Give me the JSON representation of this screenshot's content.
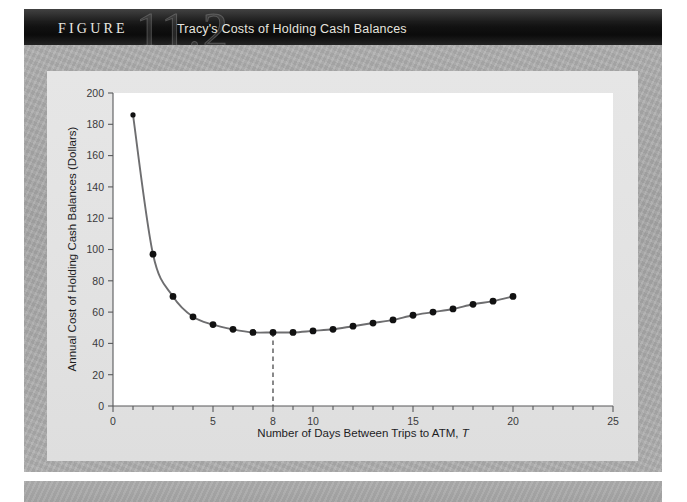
{
  "banner": {
    "figure_word": "FIGURE",
    "figure_number": "11.2",
    "title": "Tracy's Costs of Holding Cash Balances"
  },
  "chart_data": {
    "type": "line",
    "title": "Tracy's Costs of Holding Cash Balances",
    "xlabel": "Number of Days Between Trips to ATM, T",
    "ylabel": "Annual Cost of Holding Cash Balances (Dollars)",
    "xlim": [
      0,
      25
    ],
    "ylim": [
      0,
      200
    ],
    "grid": false,
    "legend": null,
    "x_ticks_major": [
      0,
      5,
      8,
      10,
      15,
      20,
      25
    ],
    "x_tick_labels": [
      "0",
      "5",
      "8",
      "10",
      "15",
      "20",
      "25"
    ],
    "x_ticks_minor_step": 1,
    "y_ticks": [
      0,
      20,
      40,
      60,
      80,
      100,
      120,
      140,
      160,
      180,
      200
    ],
    "y_tick_labels": [
      "0",
      "20",
      "40",
      "60",
      "80",
      "100",
      "120",
      "140",
      "160",
      "180",
      "200"
    ],
    "x": [
      1,
      2,
      3,
      4,
      5,
      6,
      7,
      8,
      9,
      10,
      11,
      12,
      13,
      14,
      15,
      16,
      17,
      18,
      19,
      20
    ],
    "values": [
      186,
      97,
      70,
      57,
      52,
      49,
      47,
      47,
      47,
      48,
      49,
      51,
      53,
      55,
      58,
      60,
      62,
      65,
      67,
      70
    ],
    "series_name": "Total annual cost",
    "markers": true,
    "marker_color": "#111111",
    "line_color": "#6e6e70",
    "annotation": {
      "type": "vertical-dashed-line",
      "x": 8,
      "label": "8",
      "description": "Cost-minimizing number of days between ATM trips"
    }
  },
  "colors": {
    "banner_background": "#0b0b0b",
    "outer_field": "#aaaaaa",
    "panel": "#e4e4e4",
    "plot_background": "#ffffff",
    "axis": "#58595b"
  }
}
